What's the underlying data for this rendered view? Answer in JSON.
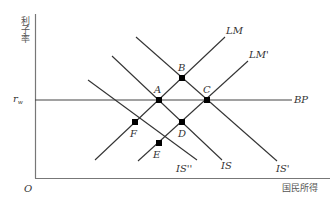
{
  "diagram": {
    "type": "IS-LM-BP",
    "y_axis_label": "利子率",
    "x_axis_label": "国民所得",
    "origin_label": "O",
    "rate_label": "r",
    "rate_subscript": "w",
    "curves": {
      "LM": "LM",
      "LM_prime": "LM'",
      "IS": "IS",
      "IS_prime": "IS'",
      "IS_double_prime": "IS''",
      "BP": "BP"
    },
    "points": {
      "A": "A",
      "B": "B",
      "C": "C",
      "D": "D",
      "E": "E",
      "F": "F"
    },
    "colors": {
      "line": "#333333",
      "axis": "#777777",
      "point": "#000000"
    }
  }
}
